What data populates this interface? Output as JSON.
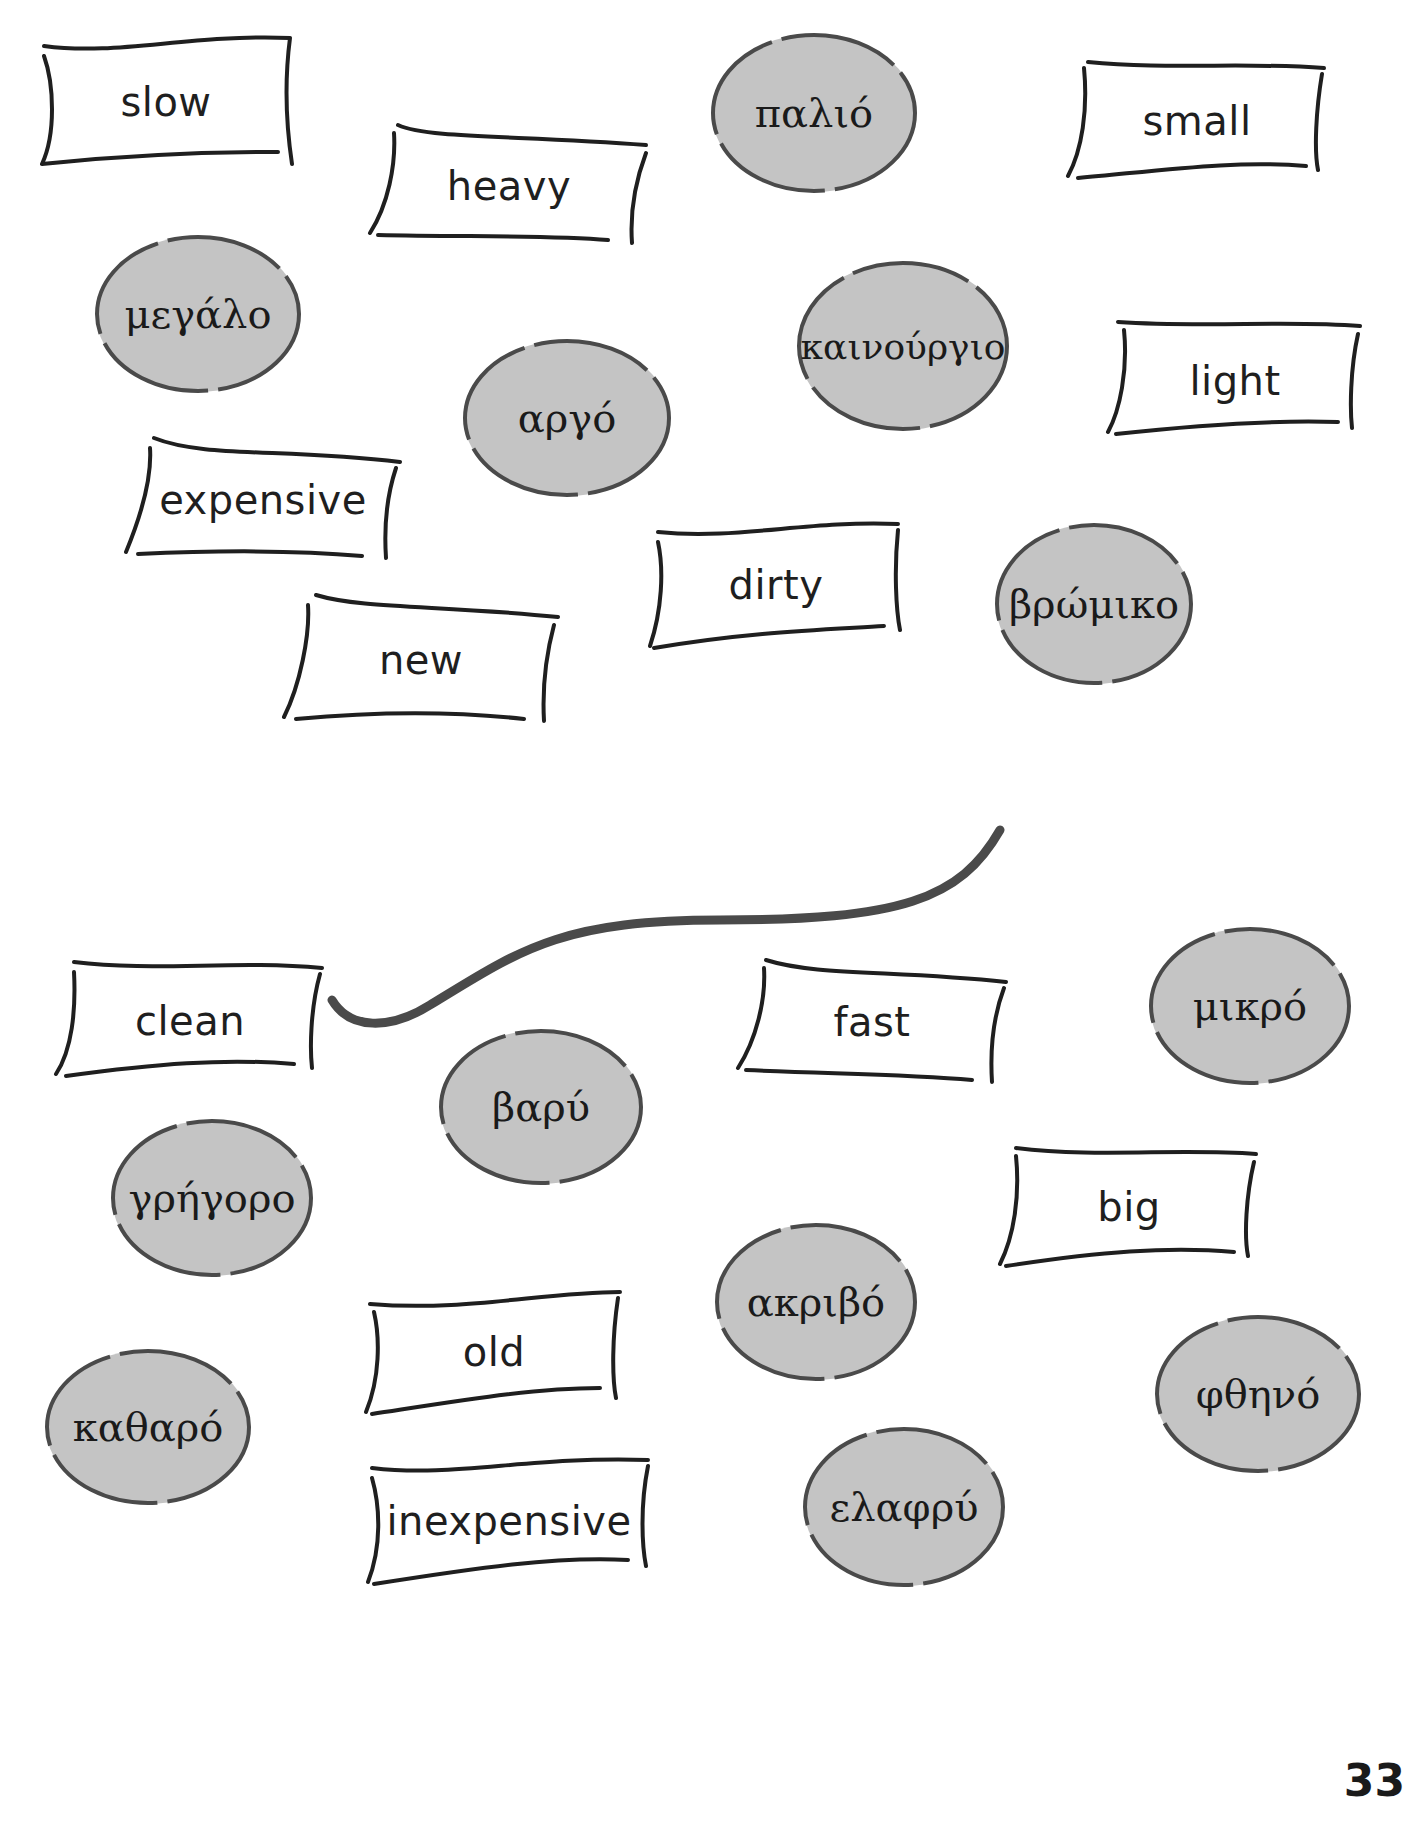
{
  "page_number": "33",
  "colors": {
    "disc_fill": "#c4c4c4",
    "disc_stroke": "#4a4a4a",
    "card_stroke": "#1f1f1f",
    "connector": "#4a4a4a"
  },
  "english_cards": [
    {
      "label": "slow"
    },
    {
      "label": "heavy"
    },
    {
      "label": "small"
    },
    {
      "label": "light"
    },
    {
      "label": "expensive"
    },
    {
      "label": "dirty"
    },
    {
      "label": "new"
    },
    {
      "label": "clean"
    },
    {
      "label": "fast"
    },
    {
      "label": "big"
    },
    {
      "label": "old"
    },
    {
      "label": "inexpensive"
    }
  ],
  "greek_discs": [
    {
      "label": "παλιό"
    },
    {
      "label": "μεγάλο"
    },
    {
      "label": "καινούργιο"
    },
    {
      "label": "αργό"
    },
    {
      "label": "βρώμικο"
    },
    {
      "label": "μικρό"
    },
    {
      "label": "βαρύ"
    },
    {
      "label": "γρήγορο"
    },
    {
      "label": "ακριβό"
    },
    {
      "label": "φθηνό"
    },
    {
      "label": "καθαρό"
    },
    {
      "label": "ελαφρύ"
    }
  ],
  "example_match": {
    "from": "clean",
    "to": "βρώμικο"
  }
}
